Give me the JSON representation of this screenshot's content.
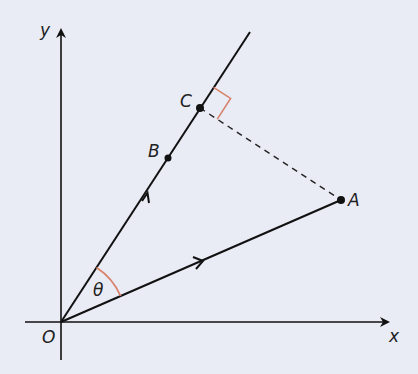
{
  "diagram": {
    "type": "vector-projection",
    "background": "#e9ebf5",
    "line_color": "#111111",
    "accent_color": "#d9826b",
    "axes": {
      "x_label": "x",
      "y_label": "y",
      "origin_label": "O"
    },
    "points": {
      "O": {
        "label": "O",
        "x": 61,
        "y": 322
      },
      "A": {
        "label": "A",
        "x": 341,
        "y": 200
      },
      "B": {
        "label": "B",
        "x": 168,
        "y": 158
      },
      "C": {
        "label": "C",
        "x": 200,
        "y": 108
      }
    },
    "angle_label": "θ",
    "annotations": [
      "Vector OA with direction arrow",
      "Line through O, B, C with direction arrow",
      "Dashed perpendicular from A to C",
      "Right-angle marker at C",
      "Angle θ between OA and OC"
    ]
  }
}
